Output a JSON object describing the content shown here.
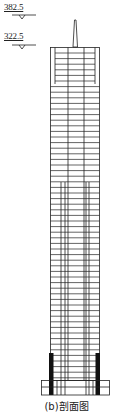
{
  "levels": [
    {
      "label": "382.5",
      "y": 4
    },
    {
      "label": "322.5",
      "y": 33
    }
  ],
  "caption": "(b)剖面图",
  "colors": {
    "line": "#222222",
    "fill": "#111111",
    "background": "#ffffff"
  }
}
